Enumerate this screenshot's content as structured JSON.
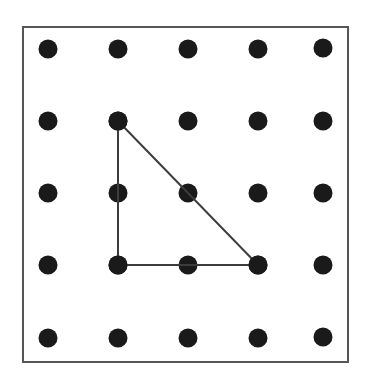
{
  "figure": {
    "type": "geoboard-diagram",
    "canvas": {
      "width": 369,
      "height": 388,
      "background": "#ffffff"
    }
  },
  "board": {
    "name": "geoboard-frame",
    "x": 23,
    "y": 27,
    "width": 325,
    "height": 335,
    "border_color": "#55565a",
    "border_width": 2,
    "fill": "#ffffff"
  },
  "grid": {
    "rows": 5,
    "cols": 5,
    "peg_color": "#1a1a1a",
    "peg_radius": 9.5,
    "col_x": [
      48,
      118,
      188,
      258,
      323
    ],
    "row_y": [
      49,
      121,
      193,
      265,
      338
    ],
    "pegs": [
      {
        "id": "peg-r1c1",
        "row": 1,
        "col": 1,
        "cx": 48,
        "cy": 49
      },
      {
        "id": "peg-r1c2",
        "row": 1,
        "col": 2,
        "cx": 118,
        "cy": 49
      },
      {
        "id": "peg-r1c3",
        "row": 1,
        "col": 3,
        "cx": 188,
        "cy": 49
      },
      {
        "id": "peg-r1c4",
        "row": 1,
        "col": 4,
        "cx": 258,
        "cy": 49
      },
      {
        "id": "peg-r1c5",
        "row": 1,
        "col": 5,
        "cx": 323,
        "cy": 48
      },
      {
        "id": "peg-r2c1",
        "row": 2,
        "col": 1,
        "cx": 48,
        "cy": 121
      },
      {
        "id": "peg-r2c2",
        "row": 2,
        "col": 2,
        "cx": 118,
        "cy": 121
      },
      {
        "id": "peg-r2c3",
        "row": 2,
        "col": 3,
        "cx": 188,
        "cy": 121
      },
      {
        "id": "peg-r2c4",
        "row": 2,
        "col": 4,
        "cx": 258,
        "cy": 121
      },
      {
        "id": "peg-r2c5",
        "row": 2,
        "col": 5,
        "cx": 323,
        "cy": 121
      },
      {
        "id": "peg-r3c1",
        "row": 3,
        "col": 1,
        "cx": 48,
        "cy": 193
      },
      {
        "id": "peg-r3c2",
        "row": 3,
        "col": 2,
        "cx": 118,
        "cy": 193
      },
      {
        "id": "peg-r3c3",
        "row": 3,
        "col": 3,
        "cx": 188,
        "cy": 193
      },
      {
        "id": "peg-r3c4",
        "row": 3,
        "col": 4,
        "cx": 258,
        "cy": 193
      },
      {
        "id": "peg-r3c5",
        "row": 3,
        "col": 5,
        "cx": 323,
        "cy": 193
      },
      {
        "id": "peg-r4c1",
        "row": 4,
        "col": 1,
        "cx": 48,
        "cy": 265
      },
      {
        "id": "peg-r4c2",
        "row": 4,
        "col": 2,
        "cx": 118,
        "cy": 265
      },
      {
        "id": "peg-r4c3",
        "row": 4,
        "col": 3,
        "cx": 188,
        "cy": 265
      },
      {
        "id": "peg-r4c4",
        "row": 4,
        "col": 4,
        "cx": 258,
        "cy": 265
      },
      {
        "id": "peg-r4c5",
        "row": 4,
        "col": 5,
        "cx": 323,
        "cy": 265
      },
      {
        "id": "peg-r5c1",
        "row": 5,
        "col": 1,
        "cx": 48,
        "cy": 338
      },
      {
        "id": "peg-r5c2",
        "row": 5,
        "col": 2,
        "cx": 118,
        "cy": 338
      },
      {
        "id": "peg-r5c3",
        "row": 5,
        "col": 3,
        "cx": 188,
        "cy": 338
      },
      {
        "id": "peg-r5c4",
        "row": 5,
        "col": 4,
        "cx": 258,
        "cy": 338
      },
      {
        "id": "peg-r5c5",
        "row": 5,
        "col": 5,
        "cx": 323,
        "cy": 337
      }
    ]
  },
  "shape": {
    "name": "right-triangle",
    "stroke_color": "#3c3c3c",
    "stroke_width": 2,
    "fill": "none",
    "vertices": [
      {
        "label": "apex",
        "peg": "peg-r2c2",
        "x": 118,
        "y": 121
      },
      {
        "label": "right-angle",
        "peg": "peg-r4c2",
        "x": 118,
        "y": 265
      },
      {
        "label": "bottom-right",
        "peg": "peg-r4c4",
        "x": 258,
        "y": 265
      }
    ],
    "points_string": "118,121 118,265 258,265 118,121",
    "edges": [
      {
        "name": "leg-vertical",
        "x1": 118,
        "y1": 121,
        "x2": 118,
        "y2": 265
      },
      {
        "name": "leg-horizontal",
        "x1": 118,
        "y1": 265,
        "x2": 258,
        "y2": 265
      },
      {
        "name": "hypotenuse",
        "x1": 258,
        "y1": 265,
        "x2": 118,
        "y2": 121
      }
    ]
  }
}
